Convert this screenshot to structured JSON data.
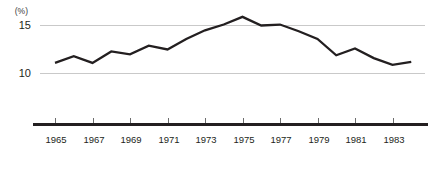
{
  "chart_data": {
    "type": "line",
    "title": "",
    "subtitle": "",
    "xlabel": "",
    "ylabel": "(%)",
    "unit_label": "(%)",
    "x": [
      1965,
      1966,
      1967,
      1968,
      1969,
      1970,
      1971,
      1972,
      1973,
      1974,
      1975,
      1976,
      1977,
      1978,
      1979,
      1980,
      1981,
      1982,
      1983,
      1984
    ],
    "values": [
      11.1,
      11.8,
      11.1,
      12.3,
      12.0,
      12.9,
      12.5,
      13.6,
      14.5,
      15.1,
      15.9,
      15.0,
      15.1,
      14.4,
      13.6,
      11.9,
      12.6,
      11.6,
      10.9,
      11.2
    ],
    "series": [
      {
        "name": "",
        "values": [
          11.1,
          11.8,
          11.1,
          12.3,
          12.0,
          12.9,
          12.5,
          13.6,
          14.5,
          15.1,
          15.9,
          15.0,
          15.1,
          14.4,
          13.6,
          11.9,
          12.6,
          11.6,
          10.9,
          11.2
        ],
        "color": "#231f20"
      }
    ],
    "xlim": [
      1965,
      1984
    ],
    "ylim": [
      9.4,
      16.6
    ],
    "y_ticks": [
      10,
      15
    ],
    "y_tick_labels": [
      "10",
      "15"
    ],
    "x_ticks": [
      1965,
      1967,
      1969,
      1971,
      1973,
      1975,
      1977,
      1979,
      1981,
      1983
    ],
    "x_tick_labels": [
      "1965",
      "1967",
      "1969",
      "1971",
      "1973",
      "1975",
      "1977",
      "1979",
      "1981",
      "1983"
    ],
    "grid": true,
    "grid_axis": "y",
    "legend": false,
    "legend_position": "none",
    "annotations": [],
    "colors": {
      "line": "#231f20",
      "grid": "#c9c9c9",
      "axis": "#231f20",
      "text": "#231f20",
      "background": "#ffffff"
    }
  }
}
